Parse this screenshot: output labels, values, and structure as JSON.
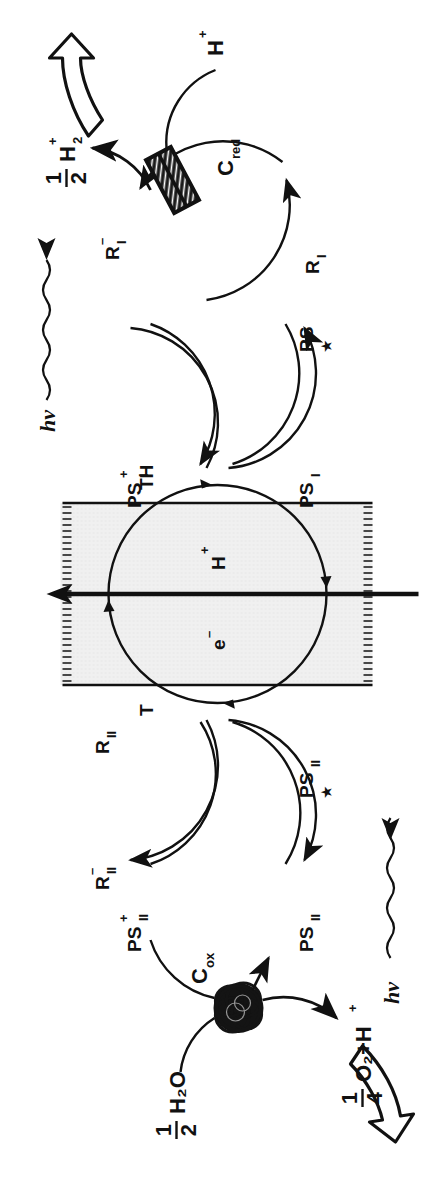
{
  "figure": {
    "kind": "z-scheme-artificial-photosynthesis-diagram",
    "orientation": "rotated-90-ccw",
    "background": "#ffffff",
    "ink": "#111111",
    "membrane_fill": "#efefef"
  },
  "water_side": {
    "input_label": "H₂O",
    "input_coefficient_num": "1",
    "input_coefficient_den": "2",
    "product_label": "O₂+H",
    "product_superscript": "+",
    "product_coefficient_num": "1",
    "product_coefficient_den": "4",
    "catalyst_label": "C",
    "catalyst_subscript": "ox",
    "catalyst_name": "oxidation-catalyst-blob",
    "output_arrow_name": "oxygen-output-block-arrow"
  },
  "hydrogen_side": {
    "input_label": "H",
    "input_superscript": "+",
    "product_label": "H",
    "product_subscript": "2",
    "product_superscript": "+",
    "product_coefficient_num": "1",
    "product_coefficient_den": "2",
    "catalyst_label": "C",
    "catalyst_subscript": "red",
    "catalyst_name": "reduction-catalyst-box",
    "output_arrow_name": "hydrogen-output-block-arrow"
  },
  "photosystem_II": {
    "ground": {
      "base": "PS",
      "sub": "II"
    },
    "excited": {
      "base": "PS",
      "sub": "II",
      "star": "★"
    },
    "oxidized": {
      "base": "PS",
      "sub": "II",
      "sup": "+"
    },
    "relay": {
      "base": "R",
      "sub": "II"
    },
    "relay_reduced": {
      "base": "R",
      "sub": "II",
      "sup": "–"
    },
    "photon_label": "hν"
  },
  "photosystem_I": {
    "ground": {
      "base": "PS",
      "sub": "I"
    },
    "excited": {
      "base": "PS",
      "star": "★"
    },
    "oxidized": {
      "base": "PS",
      "sub": "I",
      "sup": "+"
    },
    "relay": {
      "base": "R",
      "sub": "I"
    },
    "relay_reduced": {
      "base": "R",
      "sub": "I",
      "sup": "–"
    },
    "photon_label": "hν"
  },
  "membrane": {
    "carrier": "T",
    "carrier_protonated": "TH",
    "electron": {
      "base": "e",
      "sup": "–"
    },
    "proton": {
      "base": "H",
      "sup": "+"
    },
    "name": "membrane-band"
  }
}
